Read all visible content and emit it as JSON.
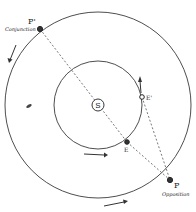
{
  "diagram": {
    "title": "",
    "sun_label": "S",
    "points": [
      {
        "id": "P_prime",
        "label": "P'",
        "note": "Conjunction"
      },
      {
        "id": "P",
        "label": "P",
        "note": "Opposition"
      },
      {
        "id": "E",
        "label": "E",
        "note": ""
      },
      {
        "id": "E_prime",
        "label": "E'",
        "note": ""
      }
    ],
    "orbits": [
      {
        "name": "inner-orbit",
        "body": "Earth"
      },
      {
        "name": "outer-orbit",
        "body": "Planet"
      }
    ],
    "colors": {
      "ink": "#222222",
      "background": "#ffffff"
    }
  }
}
